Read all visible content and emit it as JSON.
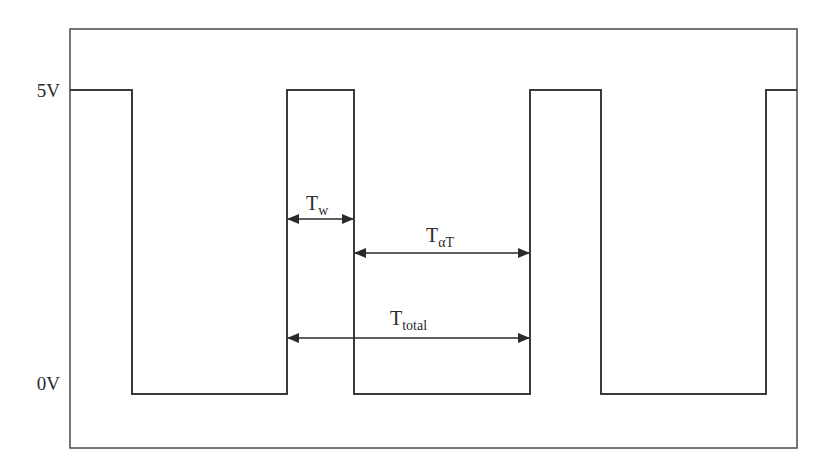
{
  "diagram": {
    "type": "pwm-waveform",
    "colors": {
      "line": "#3a3a3a",
      "text": "#2a2a2a",
      "background": "#ffffff"
    },
    "frame": {
      "x": 70,
      "y": 29,
      "width": 727,
      "height": 419
    },
    "levels": {
      "high": {
        "label": "5V",
        "y": 90
      },
      "low": {
        "label": "0V",
        "y": 394
      }
    },
    "edges_x": [
      132,
      287,
      354,
      530,
      601,
      766
    ],
    "annotations": {
      "tw": {
        "base": "T",
        "sub": "w",
        "arrow": {
          "x1": 287,
          "x2": 354,
          "y": 219
        }
      },
      "toff": {
        "base": "T",
        "sub": "αT",
        "arrow": {
          "x1": 354,
          "x2": 530,
          "y": 253
        }
      },
      "ttotal": {
        "base": "T",
        "sub": "total",
        "arrow": {
          "x1": 287,
          "x2": 530,
          "y": 338
        }
      }
    }
  }
}
